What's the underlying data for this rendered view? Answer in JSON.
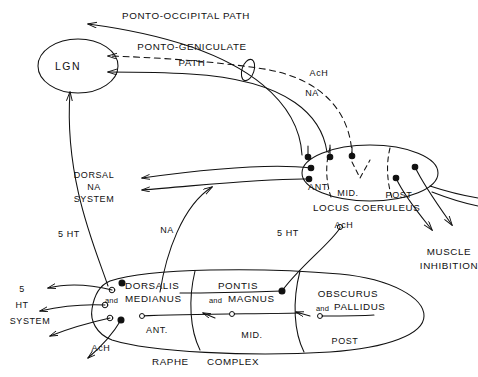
{
  "figure": {
    "stroke_color": "#111111",
    "background_color": "#ffffff"
  },
  "pathways": {
    "ponto_occipital": "PONTO-OCCIPITAL  PATH",
    "ponto_geniculate_line1": "PONTO-GENICULATE",
    "ponto_geniculate_line2": "PATH"
  },
  "nuclei": {
    "lgn": "LGN",
    "locus_coeruleus": {
      "name_line1": "LOCUS",
      "name_line2": "COERULEUS",
      "subdivisions": [
        "ANT.",
        "MID.",
        "POST"
      ]
    },
    "raphe": {
      "name_line1": "RAPHE",
      "name_line2": "COMPLEX",
      "subnuclei": [
        {
          "line1": "DORSALIS",
          "conj": "and",
          "line2": "MEDIANUS",
          "zone": "ANT."
        },
        {
          "line1": "PONTIS",
          "conj": "and",
          "line2": "MAGNUS",
          "zone": "MID."
        },
        {
          "line1": "OBSCURUS",
          "conj": "and",
          "line2": "PALLIDUS",
          "zone": "POST"
        }
      ]
    }
  },
  "neurotransmitters": {
    "ach_upper": "AcH",
    "na_upper": "NA",
    "na_mid": "NA",
    "ht_mid": "5 HT",
    "ht_left_upper": "5 HT",
    "ach_lc": "AcH",
    "ach_raphe": "AcH"
  },
  "systems": {
    "dorsal_na": {
      "line1": "DORSAL",
      "line2": "NA",
      "line3": "SYSTEM"
    },
    "ht_system": {
      "line1": "5",
      "line2": "HT",
      "line3": "SYSTEM"
    },
    "muscle_inhibition": {
      "line1": "MUSCLE",
      "line2": "INHIBITION"
    }
  }
}
